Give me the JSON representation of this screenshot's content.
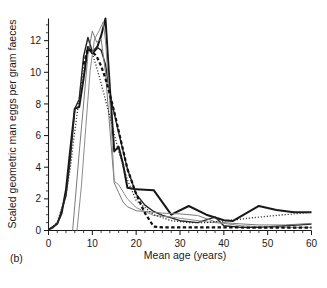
{
  "figure": {
    "panel_label": "(b)",
    "background_color": "#ffffff"
  },
  "chart_data": {
    "type": "line",
    "title": "",
    "xlabel": "Mean age (years)",
    "ylabel": "Scaled geometric man eggs per gram faeces",
    "xlim": [
      0,
      60
    ],
    "ylim": [
      0,
      13.4
    ],
    "xticks": [
      0,
      10,
      20,
      30,
      40,
      50,
      60
    ],
    "xtick_labels": [
      "0",
      "10",
      "20",
      "30",
      "40",
      "50",
      "60"
    ],
    "xminor_step": 2,
    "yticks": [
      0,
      2,
      4,
      6,
      8,
      10,
      12
    ],
    "ytick_labels": [
      "0",
      "2",
      "4",
      "6",
      "8",
      "10",
      "12"
    ],
    "yminor_step": 0.5,
    "grid": false,
    "legend": "none",
    "series": [
      {
        "name": "curve-1-thick-solid",
        "style": "solid",
        "color": "#181818",
        "width": 2.0,
        "x": [
          0,
          1,
          2,
          3,
          4,
          5,
          6,
          7,
          8,
          9,
          10,
          11,
          12,
          13,
          14,
          15,
          16,
          17,
          18,
          19,
          20,
          24,
          28,
          32,
          36,
          40,
          42,
          48,
          52,
          56,
          60
        ],
        "y": [
          0.05,
          0.2,
          0.45,
          1.1,
          2.6,
          5.2,
          7.7,
          7.8,
          9.6,
          11.6,
          11.2,
          11.5,
          12.3,
          13.4,
          9.0,
          5.0,
          5.3,
          4.2,
          2.7,
          2.65,
          2.6,
          2.55,
          1.0,
          1.55,
          1.0,
          0.65,
          0.6,
          1.55,
          1.3,
          1.15,
          1.15
        ]
      },
      {
        "name": "curve-2-solid-dark",
        "style": "solid",
        "color": "#232323",
        "width": 1.4,
        "x": [
          0,
          2,
          4,
          5,
          6,
          7,
          8,
          9,
          10,
          11,
          12,
          13,
          14,
          16,
          18,
          20,
          22,
          24,
          26,
          28,
          30,
          34,
          38,
          40,
          44,
          48,
          54,
          60
        ],
        "y": [
          0.05,
          0.4,
          2.2,
          4.6,
          7.7,
          8.3,
          11.0,
          12.2,
          11.3,
          11.6,
          11.4,
          10.5,
          8.6,
          6.2,
          3.9,
          2.3,
          1.6,
          1.2,
          0.95,
          0.8,
          0.62,
          0.5,
          0.85,
          0.3,
          0.2,
          0.2,
          0.3,
          0.4
        ]
      },
      {
        "name": "curve-3-thin-gray",
        "style": "solid",
        "color": "#7a7a7a",
        "width": 1.0,
        "x": [
          5.5,
          6,
          7,
          8,
          9,
          10,
          11,
          12,
          13,
          14,
          15,
          16,
          17,
          18,
          20,
          22,
          24,
          26,
          30,
          34,
          38,
          42,
          48,
          54,
          60
        ],
        "y": [
          0.0,
          1.6,
          4.9,
          8.0,
          11.1,
          12.6,
          11.9,
          12.1,
          10.0,
          6.4,
          3.0,
          2.4,
          1.8,
          1.5,
          1.25,
          1.2,
          1.15,
          1.1,
          1.05,
          0.95,
          0.55,
          0.45,
          0.35,
          0.35,
          0.45
        ]
      },
      {
        "name": "curve-4-thin-gray",
        "style": "solid",
        "color": "#8c8c8c",
        "width": 1.0,
        "x": [
          6.5,
          7.5,
          8.5,
          9.5,
          10.5,
          11.5,
          12.5,
          13,
          14,
          15,
          16,
          18,
          20,
          22,
          24,
          28,
          32,
          36,
          40,
          44,
          50,
          56,
          60
        ],
        "y": [
          0.0,
          2.8,
          6.5,
          10.1,
          12.1,
          12.6,
          13.2,
          12.0,
          8.1,
          3.1,
          2.9,
          2.0,
          1.45,
          1.2,
          0.95,
          0.85,
          0.7,
          0.55,
          0.45,
          0.3,
          0.22,
          0.2,
          0.2
        ]
      },
      {
        "name": "curve-5-dotted",
        "style": "dotted",
        "color": "#2b2b2b",
        "width": 1.3,
        "x": [
          0,
          2,
          4,
          5,
          6,
          7,
          8,
          9,
          10,
          11,
          12,
          14,
          16,
          18,
          20,
          24,
          28,
          32,
          36,
          40,
          44,
          48,
          52,
          56,
          60
        ],
        "y": [
          0.05,
          0.5,
          2.3,
          4.0,
          6.3,
          8.3,
          10.3,
          11.4,
          11.2,
          10.3,
          9.3,
          7.2,
          5.0,
          3.2,
          1.9,
          1.0,
          0.62,
          0.5,
          0.5,
          0.6,
          0.72,
          0.85,
          0.95,
          1.05,
          1.15
        ]
      },
      {
        "name": "curve-6-thick-dashed",
        "style": "dashed",
        "color": "#101010",
        "width": 2.2,
        "x": [
          8,
          9,
          10,
          11,
          12,
          13,
          14,
          15,
          16,
          17,
          18,
          20,
          22,
          24,
          26,
          30,
          34,
          38,
          42,
          46,
          50,
          54,
          58,
          60
        ],
        "y": [
          10.5,
          11.5,
          11.3,
          11.0,
          10.4,
          9.6,
          8.6,
          7.5,
          6.3,
          5.1,
          3.9,
          2.3,
          1.1,
          0.25,
          0.2,
          0.2,
          0.2,
          0.2,
          0.2,
          0.18,
          0.18,
          0.18,
          0.18,
          0.18
        ]
      }
    ]
  }
}
